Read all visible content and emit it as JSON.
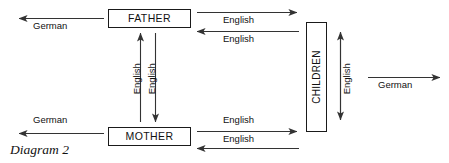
{
  "diagram": {
    "caption": "Diagram 2",
    "background_color": "#ffffff",
    "line_color": "#333333",
    "text_color": "#111111",
    "nodes": [
      {
        "id": "father",
        "label": "FATHER",
        "orientation": "horizontal"
      },
      {
        "id": "mother",
        "label": "MOTHER",
        "orientation": "horizontal"
      },
      {
        "id": "children",
        "label": "CHILDREN",
        "orientation": "vertical"
      }
    ],
    "edges": [
      {
        "id": "father-outward-german",
        "label": "German",
        "direction": "left",
        "from": "father",
        "to": "outside"
      },
      {
        "id": "mother-outward-german",
        "label": "German",
        "direction": "left",
        "from": "mother",
        "to": "outside"
      },
      {
        "id": "children-outward-german",
        "label": "German",
        "direction": "right",
        "from": "children",
        "to": "outside"
      },
      {
        "id": "father-to-children-english",
        "label": "English",
        "direction": "right",
        "from": "father",
        "to": "children"
      },
      {
        "id": "children-to-father-english",
        "label": "English",
        "direction": "left",
        "from": "children",
        "to": "father"
      },
      {
        "id": "mother-to-children-english",
        "label": "English",
        "direction": "right",
        "from": "mother",
        "to": "children"
      },
      {
        "id": "children-to-mother-english",
        "label": "English",
        "direction": "left",
        "from": "children",
        "to": "mother"
      },
      {
        "id": "mother-to-father-english",
        "label": "English",
        "direction": "up",
        "from": "mother",
        "to": "father"
      },
      {
        "id": "father-to-mother-english",
        "label": "English",
        "direction": "down",
        "from": "father",
        "to": "mother"
      },
      {
        "id": "children-internal-english",
        "label": "English",
        "direction": "bidirectional-vertical",
        "from": "children",
        "to": "children"
      }
    ]
  }
}
